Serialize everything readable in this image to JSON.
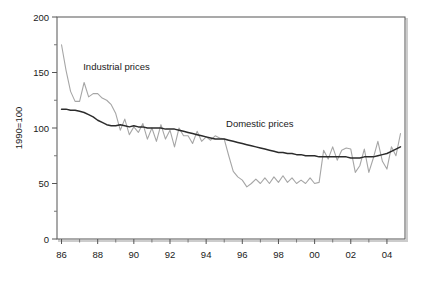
{
  "chart_data": {
    "type": "line",
    "title": "",
    "subtitle": "",
    "xlabel": "",
    "ylabel": "1990=100",
    "xlim": [
      1985.75,
      2005.0
    ],
    "ylim": [
      0,
      200
    ],
    "grid": false,
    "legend_position": "inline-annotation",
    "y_ticks_major": [
      0,
      50,
      100,
      150,
      200
    ],
    "y_tick_labels": [
      "0",
      "50",
      "100",
      "150",
      "200"
    ],
    "y_ticks_minor": [
      25,
      75,
      125,
      175
    ],
    "x_ticks_major": [
      1986,
      1988,
      1990,
      1992,
      1994,
      1996,
      1998,
      2000,
      2002,
      2004
    ],
    "x_tick_labels": [
      "86",
      "88",
      "90",
      "92",
      "94",
      "96",
      "98",
      "00",
      "02",
      "04"
    ],
    "x_ticks_minor": [
      1987,
      1989,
      1991,
      1993,
      1995,
      1997,
      1999,
      2001,
      2003
    ],
    "series": [
      {
        "name": "Industrial prices",
        "color": "#a6a6a6",
        "label_x": 1987.2,
        "label_y": 152,
        "x": [
          1986.0,
          1986.25,
          1986.5,
          1986.75,
          1987.0,
          1987.25,
          1987.5,
          1987.75,
          1988.0,
          1988.25,
          1988.5,
          1988.75,
          1989.0,
          1989.25,
          1989.5,
          1989.75,
          1990.0,
          1990.25,
          1990.5,
          1990.75,
          1991.0,
          1991.25,
          1991.5,
          1991.75,
          1992.0,
          1992.25,
          1992.5,
          1992.75,
          1993.0,
          1993.25,
          1993.5,
          1993.75,
          1994.0,
          1994.25,
          1994.5,
          1994.75,
          1995.0,
          1995.25,
          1995.5,
          1995.75,
          1996.0,
          1996.25,
          1996.5,
          1996.75,
          1997.0,
          1997.25,
          1997.5,
          1997.75,
          1998.0,
          1998.25,
          1998.5,
          1998.75,
          1999.0,
          1999.25,
          1999.5,
          1999.75,
          2000.0,
          2000.25,
          2000.5,
          2000.75,
          2001.0,
          2001.25,
          2001.5,
          2001.75,
          2002.0,
          2002.25,
          2002.5,
          2002.75,
          2003.0,
          2003.25,
          2003.5,
          2003.75,
          2004.0,
          2004.25,
          2004.5,
          2004.75
        ],
        "values": [
          175,
          152,
          133,
          124,
          124,
          141,
          128,
          131,
          131,
          127,
          125,
          121,
          113,
          98,
          108,
          94,
          101,
          96,
          104,
          90,
          100,
          88,
          103,
          90,
          98,
          83,
          100,
          93,
          93,
          86,
          97,
          88,
          92,
          89,
          93,
          91,
          90,
          75,
          61,
          56,
          53,
          47,
          50,
          54,
          50,
          55,
          50,
          56,
          51,
          57,
          51,
          55,
          50,
          53,
          50,
          55,
          50,
          51,
          80,
          72,
          83,
          71,
          80,
          82,
          81,
          60,
          66,
          81,
          60,
          73,
          88,
          70,
          63,
          83,
          75,
          95
        ]
      },
      {
        "name": "Domestic prices",
        "color": "#2b2b2b",
        "label_x": 1995.1,
        "label_y": 101,
        "x": [
          1986.0,
          1986.25,
          1986.5,
          1986.75,
          1987.0,
          1987.25,
          1987.5,
          1987.75,
          1988.0,
          1988.25,
          1988.5,
          1988.75,
          1989.0,
          1989.25,
          1989.5,
          1989.75,
          1990.0,
          1990.25,
          1990.5,
          1990.75,
          1991.0,
          1991.25,
          1991.5,
          1991.75,
          1992.0,
          1992.25,
          1992.5,
          1992.75,
          1993.0,
          1993.25,
          1993.5,
          1993.75,
          1994.0,
          1994.25,
          1994.5,
          1994.75,
          1995.0,
          1995.25,
          1995.5,
          1995.75,
          1996.0,
          1996.25,
          1996.5,
          1996.75,
          1997.0,
          1997.25,
          1997.5,
          1997.75,
          1998.0,
          1998.25,
          1998.5,
          1998.75,
          1999.0,
          1999.25,
          1999.5,
          1999.75,
          2000.0,
          2000.25,
          2000.5,
          2000.75,
          2001.0,
          2001.25,
          2001.5,
          2001.75,
          2002.0,
          2002.25,
          2002.5,
          2002.75,
          2003.0,
          2003.25,
          2003.5,
          2003.75,
          2004.0,
          2004.25,
          2004.5,
          2004.75
        ],
        "values": [
          117,
          117,
          116,
          116,
          115,
          114,
          112,
          110,
          107,
          105,
          103,
          102,
          102,
          103,
          102,
          101,
          102,
          101,
          101,
          100,
          100,
          100,
          100,
          99,
          99,
          99,
          98,
          97,
          96,
          95,
          94,
          93,
          92,
          91,
          90,
          90,
          90,
          89,
          88,
          87,
          86,
          85,
          84,
          83,
          82,
          81,
          80,
          79,
          78,
          78,
          77,
          77,
          76,
          76,
          75,
          75,
          75,
          74,
          74,
          74,
          74,
          74,
          74,
          74,
          73,
          73,
          73,
          74,
          74,
          74,
          75,
          76,
          77,
          79,
          81,
          83
        ]
      }
    ],
    "annotations": [
      {
        "text": "Industrial prices",
        "x": 1987.2,
        "y": 152
      },
      {
        "text": "Domestic prices",
        "x": 1995.1,
        "y": 101
      }
    ]
  },
  "frame": {
    "border_color": "#555555",
    "shadow_color": "#c8c8c8",
    "background": "#ffffff"
  }
}
